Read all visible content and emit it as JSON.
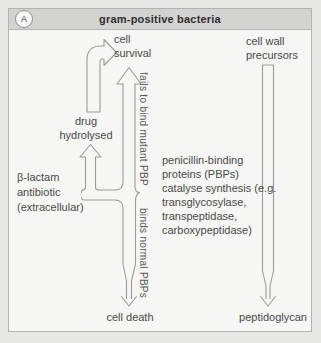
{
  "panel": {
    "badge": "A",
    "header_title": "gram-positive bacteria"
  },
  "nodes": {
    "cell_survival": "cell\nsurvival",
    "cell_wall_precursors": "cell wall\nprecursors",
    "drug_hydrolysed": "drug\nhydrolysed",
    "beta_lactam_antibiotic": "β-lactam\nantibiotic\n(extracellular)",
    "pbp_annotation": "penicillin-binding\nproteins (PBPs)\ncatalyse synthesis (e.g.\ntransglycosylase,\ntranspeptidase,\ncarboxypeptidase)",
    "cell_death": "cell death",
    "peptidoglycan": "peptidoglycan"
  },
  "arrow_labels": {
    "fails_to_bind": "fails to bind mutant PBP",
    "binds_normal": "binds normal PBPs"
  },
  "colors": {
    "page_bg": "#e7e7e5",
    "panel_bg": "#f6f6f4",
    "header_bg": "#d3d3d1",
    "border": "#b3b3b1",
    "arrow_stroke": "#9c9c9c",
    "text": "#494949"
  }
}
